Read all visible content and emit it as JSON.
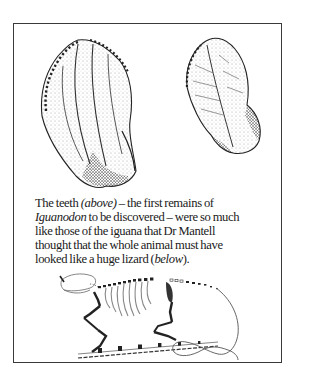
{
  "figure": {
    "top_illustration": {
      "subject": "Iguanodon teeth",
      "items": [
        "tooth-large-left",
        "tooth-small-right"
      ]
    },
    "caption": {
      "lines": [
        {
          "parts": [
            {
              "text": "The teeth ",
              "italic": false
            },
            {
              "text": "(above)",
              "italic": true
            },
            {
              "text": " – the first remains of",
              "italic": false
            }
          ]
        },
        {
          "parts": [
            {
              "text": "Iguanodon",
              "italic": true
            },
            {
              "text": " to be discovered – were so much",
              "italic": false
            }
          ]
        },
        {
          "parts": [
            {
              "text": "like those of the iguana that Dr Mantell",
              "italic": false
            }
          ]
        },
        {
          "parts": [
            {
              "text": "thought that the whole animal must have",
              "italic": false
            }
          ]
        },
        {
          "parts": [
            {
              "text": "looked like a huge lizard (",
              "italic": false
            },
            {
              "text": "below",
              "italic": true
            },
            {
              "text": ").",
              "italic": false
            }
          ]
        }
      ]
    },
    "bottom_illustration": {
      "subject": "Lizard-like skeleton reconstruction"
    }
  }
}
